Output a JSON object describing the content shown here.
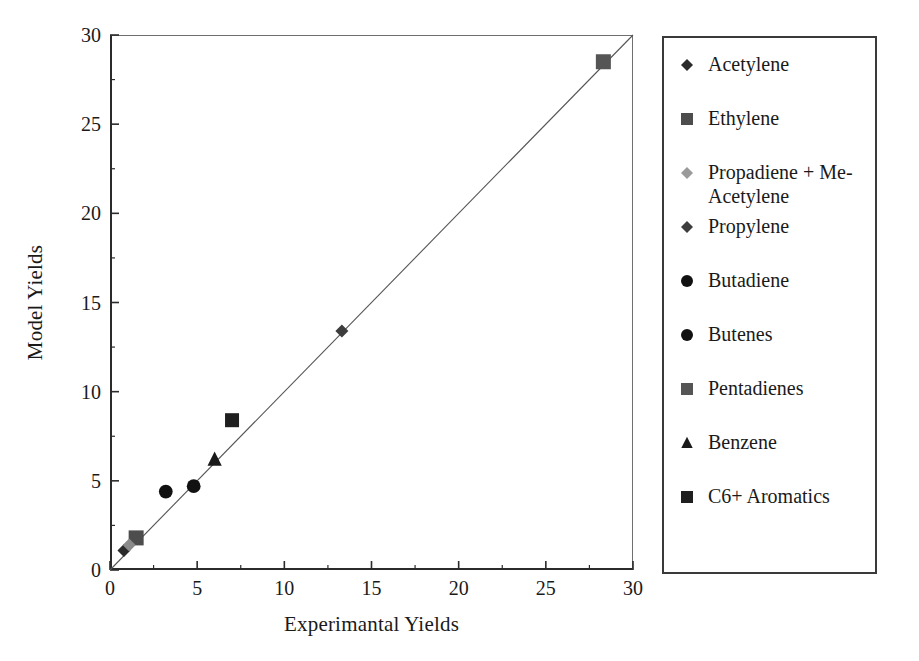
{
  "chart_data": {
    "type": "scatter",
    "title": "",
    "xlabel": "Experimantal Yields",
    "ylabel": "Model Yields",
    "xlim": [
      0,
      30
    ],
    "ylim": [
      0,
      30
    ],
    "xticks": [
      "0",
      "5",
      "10",
      "15",
      "20",
      "25",
      "30"
    ],
    "yticks": [
      "0",
      "5",
      "10",
      "15",
      "20",
      "25",
      "30"
    ],
    "xtick_values": [
      0,
      5,
      10,
      15,
      20,
      25,
      30
    ],
    "ytick_values": [
      0,
      5,
      10,
      15,
      20,
      25,
      30
    ],
    "minor_tick_interval": 2.5,
    "grid": false,
    "legend_position": "right-outside",
    "reference_line": {
      "name": "parity-line",
      "from": [
        0,
        0
      ],
      "to": [
        30,
        30
      ],
      "color": "#555555"
    },
    "series": [
      {
        "name": "Acetylene",
        "marker": "diamond",
        "color": "#2a2a2a",
        "size": 13,
        "x": 0.8,
        "y": 1.1
      },
      {
        "name": "Ethylene",
        "marker": "square",
        "color": "#4d4d4d",
        "size": 15,
        "x": 1.5,
        "y": 1.8
      },
      {
        "name": "Propadiene + Me-Acetylene",
        "marker": "diamond",
        "color": "#8a8a8a",
        "size": 13,
        "x": 1.1,
        "y": 1.4
      },
      {
        "name": "Propylene",
        "marker": "diamond",
        "color": "#3d3d3d",
        "size": 13,
        "x": 13.3,
        "y": 13.4
      },
      {
        "name": "Butadiene",
        "marker": "circle",
        "color": "#111111",
        "size": 15,
        "x": 3.2,
        "y": 4.4
      },
      {
        "name": "Butenes",
        "marker": "circle",
        "color": "#111111",
        "size": 15,
        "x": 4.8,
        "y": 4.7
      },
      {
        "name": "Pentadienes",
        "marker": "square",
        "color": "#555555",
        "size": 15,
        "x": 28.3,
        "y": 28.5
      },
      {
        "name": "Benzene",
        "marker": "triangle",
        "color": "#1a1a1a",
        "size": 15,
        "x": 6.0,
        "y": 6.2
      },
      {
        "name": "C6+ Aromatics",
        "marker": "square",
        "color": "#1f1f1f",
        "size": 14,
        "x": 7.0,
        "y": 8.4
      }
    ]
  },
  "axes": {
    "x_label": "Experimantal Yields",
    "y_label": "Model Yields",
    "x_ticks": [
      "0",
      "5",
      "10",
      "15",
      "20",
      "25",
      "30"
    ],
    "y_ticks": [
      "0",
      "5",
      "10",
      "15",
      "20",
      "25",
      "30"
    ]
  },
  "legend": {
    "items": [
      {
        "label": "Acetylene",
        "marker": "diamond",
        "color": "#2a2a2a",
        "icon": "diamond-marker-icon"
      },
      {
        "label": "Ethylene",
        "marker": "square",
        "color": "#4d4d4d",
        "icon": "square-marker-icon"
      },
      {
        "label": "Propadiene + Me-Acetylene",
        "marker": "diamond",
        "color": "#9a9a9a",
        "icon": "diamond-marker-icon"
      },
      {
        "label": "Propylene",
        "marker": "diamond",
        "color": "#3d3d3d",
        "icon": "diamond-marker-icon"
      },
      {
        "label": "Butadiene",
        "marker": "circle",
        "color": "#111111",
        "icon": "circle-marker-icon"
      },
      {
        "label": "Butenes",
        "marker": "circle",
        "color": "#111111",
        "icon": "circle-marker-icon"
      },
      {
        "label": "Pentadienes",
        "marker": "square",
        "color": "#555555",
        "icon": "square-marker-icon"
      },
      {
        "label": "Benzene",
        "marker": "triangle",
        "color": "#1a1a1a",
        "icon": "triangle-marker-icon"
      },
      {
        "label": "C6+ Aromatics",
        "marker": "square",
        "color": "#1f1f1f",
        "icon": "square-marker-icon"
      }
    ]
  },
  "colors": {
    "axis": "#2b2b2b",
    "frame_light": "#6f6f6f",
    "line": "#555555",
    "text": "#1a1a1a",
    "background": "#ffffff",
    "legend_border": "#3a3a3a"
  }
}
